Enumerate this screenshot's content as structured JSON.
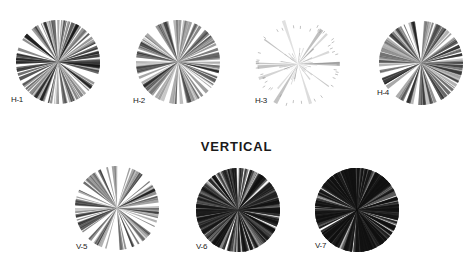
{
  "figure": {
    "section_heading": "VERTICAL",
    "roses": [
      {
        "id": "H-1",
        "label": "H-1",
        "group": "horizontal",
        "cx": 58,
        "cy": 62,
        "r": 42,
        "density": 70,
        "intensity": 0.75,
        "seed": 11,
        "label_x": 11,
        "label_y": 103
      },
      {
        "id": "H-2",
        "label": "H-2",
        "group": "horizontal",
        "cx": 178,
        "cy": 62,
        "r": 42,
        "density": 55,
        "intensity": 0.6,
        "seed": 23,
        "label_x": 133,
        "label_y": 104
      },
      {
        "id": "H-3",
        "label": "H-3",
        "group": "horizontal",
        "cx": 298,
        "cy": 64,
        "r": 44,
        "density": 30,
        "intensity": 0.3,
        "seed": 37,
        "label_x": 255,
        "label_y": 104
      },
      {
        "id": "H-4",
        "label": "H-4",
        "group": "horizontal",
        "cx": 421,
        "cy": 63,
        "r": 42,
        "density": 60,
        "intensity": 0.7,
        "seed": 41,
        "label_x": 377,
        "label_y": 96
      },
      {
        "id": "V-5",
        "label": "V-5",
        "group": "vertical",
        "cx": 117,
        "cy": 208,
        "r": 42,
        "density": 50,
        "intensity": 0.65,
        "seed": 53,
        "label_x": 76,
        "label_y": 250
      },
      {
        "id": "V-6",
        "label": "V-6",
        "group": "vertical",
        "cx": 238,
        "cy": 210,
        "r": 42,
        "density": 140,
        "intensity": 0.9,
        "seed": 67,
        "label_x": 196,
        "label_y": 250
      },
      {
        "id": "V-7",
        "label": "V-7",
        "group": "vertical",
        "cx": 357,
        "cy": 210,
        "r": 42,
        "density": 200,
        "intensity": 1.0,
        "seed": 79,
        "label_x": 315,
        "label_y": 249
      }
    ],
    "colors": {
      "ink": "#111111",
      "background": "#ffffff"
    }
  }
}
